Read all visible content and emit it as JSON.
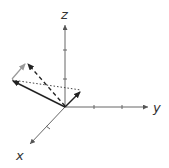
{
  "diagram": {
    "type": "3d-vector-addition",
    "axes": {
      "x": {
        "label": "x"
      },
      "y": {
        "label": "y"
      },
      "z": {
        "label": "z"
      }
    },
    "vectors": [
      {
        "name": "vector-a",
        "style": "solid",
        "color": "#222222"
      },
      {
        "name": "vector-b",
        "style": "solid",
        "color": "#222222"
      },
      {
        "name": "vector-b-translated",
        "style": "solid",
        "color": "#999999"
      },
      {
        "name": "resultant",
        "style": "dashed",
        "color": "#222222"
      },
      {
        "name": "difference",
        "style": "dotted",
        "color": "#222222"
      }
    ]
  }
}
